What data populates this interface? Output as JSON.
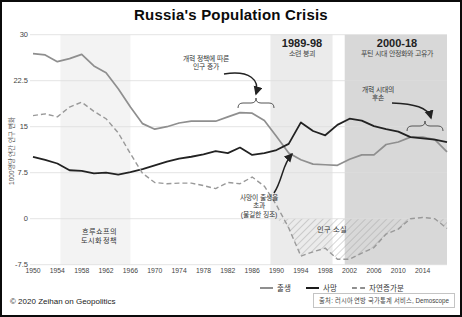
{
  "title": "Russia's Population Crisis",
  "copyright": "© 2020 Zeihan on Geopolitics",
  "source": "출처: 러시아 연방 국가통계 서비스, Demoscope",
  "y_axis": {
    "label": "1000명당 연간 인구 변화"
  },
  "bands": [
    {
      "name": "khrushchev-era",
      "label": "",
      "subtitle": "",
      "from": 1954.5,
      "to": 1966,
      "color": "#f3f3f3"
    },
    {
      "name": "soviet-collapse",
      "label": "1989-98",
      "subtitle": "소련 붕괴",
      "from": 1989,
      "to": 1999.2,
      "color": "#ebebeb"
    },
    {
      "name": "putin-era",
      "label": "2000-18",
      "subtitle": "푸틴 시대 안정화와 고유가",
      "from": 2001.2,
      "to": 2018,
      "color": "#d8d8d8"
    }
  ],
  "annotations": {
    "reform_growth": {
      "lines": [
        "개혁 정책에 따른",
        "인구 증가"
      ]
    },
    "reform_descendants": {
      "lines": [
        "개혁 시대의",
        "후손"
      ]
    },
    "deaths_exceed": {
      "lines": [
        "사망이 출생을",
        "초과",
        "(불길한 징조)"
      ]
    },
    "khrushchev": {
      "lines": [
        "흐루쇼프의",
        "도시화 정책"
      ]
    },
    "population_loss": {
      "lines": [
        "인구 소실"
      ]
    }
  },
  "legend": {
    "items": [
      {
        "label": "출생",
        "style": "solid-gray"
      },
      {
        "label": "사망",
        "style": "solid-black"
      },
      {
        "label": "자연증가분",
        "style": "dashed-gray"
      }
    ]
  },
  "chart_data": {
    "type": "line",
    "title": "Russia's Population Crisis",
    "xlabel": "",
    "ylabel": "1000명당 연간 인구 변화",
    "ylim": [
      -7.5,
      30
    ],
    "xlim": [
      1950,
      2018
    ],
    "grid": true,
    "legend_position": "bottom",
    "y_ticks": [
      30,
      22.5,
      15,
      7.5,
      0,
      -7.5
    ],
    "x_ticks": [
      1950,
      1954,
      1958,
      1962,
      1966,
      1970,
      1974,
      1978,
      1982,
      1986,
      1990,
      1994,
      1998,
      2002,
      2006,
      2010,
      2014
    ],
    "x": [
      1950,
      1952,
      1954,
      1956,
      1958,
      1960,
      1962,
      1964,
      1966,
      1968,
      1970,
      1972,
      1974,
      1976,
      1978,
      1980,
      1982,
      1984,
      1986,
      1988,
      1990,
      1992,
      1994,
      1996,
      1998,
      2000,
      2002,
      2004,
      2006,
      2008,
      2010,
      2012,
      2014,
      2016,
      2018
    ],
    "series": [
      {
        "name": "출생",
        "color": "#8f8f8f",
        "dash": false,
        "width": 1.7,
        "values": [
          26.9,
          26.7,
          25.6,
          26.1,
          26.8,
          24.9,
          23.8,
          21.2,
          18.2,
          15.5,
          14.6,
          15.0,
          15.6,
          15.9,
          15.9,
          15.9,
          16.6,
          17.3,
          17.2,
          16.0,
          13.4,
          10.7,
          9.6,
          8.9,
          8.8,
          8.7,
          9.7,
          10.4,
          10.4,
          12.1,
          12.5,
          13.3,
          13.3,
          12.9,
          10.9
        ]
      },
      {
        "name": "사망",
        "color": "#222222",
        "dash": false,
        "width": 1.8,
        "values": [
          10.1,
          9.6,
          9.0,
          7.9,
          7.8,
          7.4,
          7.5,
          7.2,
          7.6,
          8.1,
          8.7,
          9.3,
          9.8,
          10.1,
          10.5,
          11.0,
          10.7,
          11.6,
          10.4,
          10.7,
          11.2,
          12.2,
          15.7,
          14.3,
          13.6,
          15.3,
          16.3,
          16.0,
          15.1,
          14.6,
          14.2,
          13.3,
          13.1,
          12.9,
          12.5
        ]
      },
      {
        "name": "자연증가분",
        "color": "#999999",
        "dash": true,
        "width": 1.4,
        "values": [
          16.8,
          17.1,
          16.6,
          18.2,
          19.0,
          17.5,
          16.3,
          14.0,
          10.6,
          7.4,
          5.9,
          5.7,
          5.8,
          5.8,
          5.4,
          4.9,
          5.9,
          5.7,
          6.8,
          5.3,
          2.2,
          -1.5,
          -6.1,
          -5.4,
          -4.8,
          -6.6,
          -6.6,
          -5.6,
          -4.7,
          -2.5,
          -1.7,
          0.0,
          0.2,
          0.0,
          -1.6
        ]
      }
    ],
    "hatched_region": {
      "label": "인구 소실",
      "meaning": "natural increase below zero, ~1992-2012"
    }
  }
}
